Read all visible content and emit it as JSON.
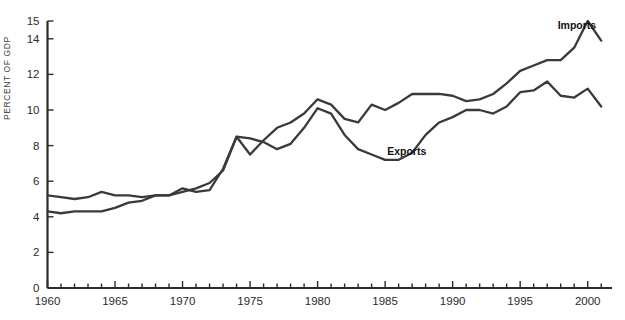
{
  "chart_data": {
    "type": "line",
    "title": "",
    "subtitle": "",
    "xlabel": "",
    "ylabel": "PERCENT OF GDP",
    "xlim": [
      1960,
      2001.8
    ],
    "ylim": [
      0,
      15
    ],
    "grid": false,
    "legend_position": "inline-annotations",
    "y_ticks": [
      0,
      2,
      4,
      6,
      8,
      10,
      12,
      14,
      15
    ],
    "y_tick_labels": [
      "0",
      "2",
      "4",
      "6",
      "8",
      "10",
      "12",
      "14",
      "15"
    ],
    "x_ticks_major": [
      1960,
      1965,
      1970,
      1975,
      1980,
      1985,
      1990,
      1995,
      2000
    ],
    "x_tick_labels": [
      "1960",
      "1965",
      "1970",
      "1975",
      "1980",
      "1985",
      "1990",
      "1995",
      "2000"
    ],
    "x_minor_tick_interval": 1,
    "x": [
      1960,
      1961,
      1962,
      1963,
      1964,
      1965,
      1966,
      1967,
      1968,
      1969,
      1970,
      1971,
      1972,
      1973,
      1974,
      1975,
      1976,
      1977,
      1978,
      1979,
      1980,
      1981,
      1982,
      1983,
      1984,
      1985,
      1986,
      1987,
      1988,
      1989,
      1990,
      1991,
      1992,
      1993,
      1994,
      1995,
      1996,
      1997,
      1998,
      1999,
      2000,
      2001
    ],
    "series": [
      {
        "name": "Imports",
        "color": "#3a3a3a",
        "label_x": 1999.2,
        "label_y": 14.55,
        "values": [
          4.3,
          4.2,
          4.3,
          4.3,
          4.3,
          4.5,
          4.8,
          4.9,
          5.2,
          5.2,
          5.4,
          5.6,
          5.9,
          6.6,
          8.5,
          7.5,
          8.3,
          9.0,
          9.3,
          9.8,
          10.6,
          10.3,
          9.5,
          9.3,
          10.3,
          10.0,
          10.4,
          10.9,
          10.9,
          10.9,
          10.8,
          10.5,
          10.6,
          10.9,
          11.5,
          12.2,
          12.5,
          12.8,
          12.8,
          13.5,
          15.0,
          13.9
        ]
      },
      {
        "name": "Exports",
        "color": "#3a3a3a",
        "label_x": 1986.6,
        "label_y": 7.5,
        "values": [
          5.2,
          5.1,
          5.0,
          5.1,
          5.4,
          5.2,
          5.2,
          5.1,
          5.2,
          5.2,
          5.6,
          5.4,
          5.5,
          6.7,
          8.5,
          8.4,
          8.2,
          7.8,
          8.1,
          9.0,
          10.1,
          9.8,
          8.6,
          7.8,
          7.5,
          7.2,
          7.2,
          7.6,
          8.6,
          9.3,
          9.6,
          10.0,
          10.0,
          9.8,
          10.2,
          11.0,
          11.1,
          11.6,
          10.8,
          10.7,
          11.2,
          10.2
        ]
      }
    ]
  },
  "axis": {
    "y_title": "PERCENT OF GDP"
  }
}
